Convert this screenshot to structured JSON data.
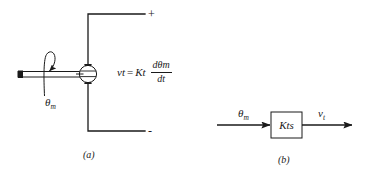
{
  "figure": {
    "kind": "tachometer-schematic-and-block-diagram",
    "background_color": "#ffffff",
    "line_color": "#1a1a1a"
  },
  "part_a": {
    "caption": "(a)",
    "terminal_plus": "+",
    "terminal_minus": "-",
    "shaft_angle_label": {
      "symbol": "θ",
      "subscript": "m"
    },
    "equation": {
      "lhs_symbol": "v",
      "lhs_subscript": "t",
      "equals": "=",
      "gain_symbol": "K",
      "gain_subscript": "t",
      "numerator_d": "d",
      "numerator_symbol": "θ",
      "numerator_subscript": "m",
      "denominator": "dt",
      "plain_text": "v_t = K_t dθ_m/dt"
    }
  },
  "part_b": {
    "caption": "(b)",
    "input_label": {
      "symbol": "θ",
      "subscript": "m"
    },
    "block_label": {
      "gain_symbol": "K",
      "gain_subscript": "t",
      "operator": "s",
      "plain_text": "K_t s"
    },
    "output_label": {
      "symbol": "v",
      "subscript": "t"
    }
  }
}
